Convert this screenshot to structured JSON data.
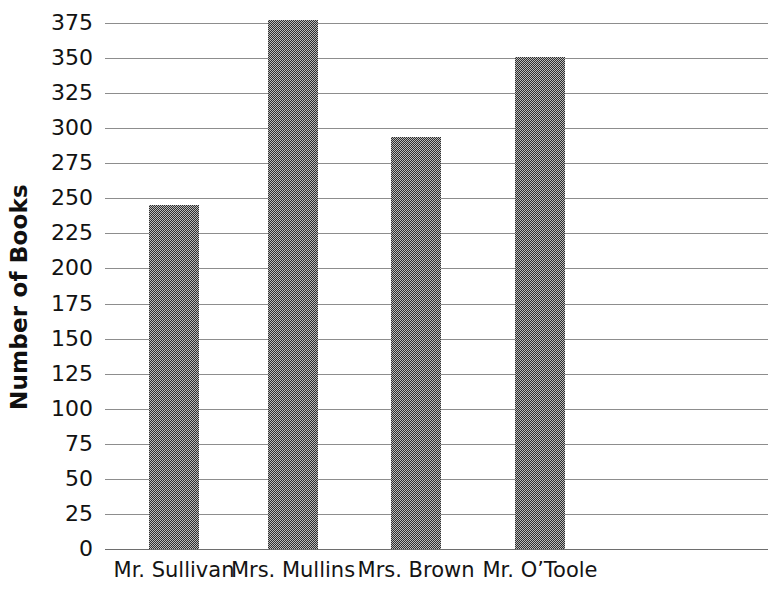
{
  "chart_data": {
    "type": "bar",
    "title": "",
    "xlabel": "",
    "ylabel": "Number of Books",
    "categories": [
      "Mr. Sullivan",
      "Mrs. Mullins",
      "Mrs. Brown",
      "Mr. O’Toole"
    ],
    "values": [
      245,
      377,
      294,
      351
    ],
    "ylim": [
      0,
      375
    ],
    "ytick_step": 25,
    "ytick_labels": [
      "375",
      "350",
      "325",
      "300",
      "275",
      "250",
      "225",
      "200",
      "175",
      "150",
      "125",
      "100",
      "75",
      "50",
      "25",
      "0"
    ],
    "ytick_values": [
      375,
      350,
      325,
      300,
      275,
      250,
      225,
      200,
      175,
      150,
      125,
      100,
      75,
      50,
      25,
      0
    ],
    "grid": true,
    "legend": false,
    "bar_color": "#646464",
    "gridline_color": "#8d8d8d",
    "text_color": "#121212",
    "background_color": "#ffffff"
  },
  "axis": {
    "y_title": "Number of Books"
  }
}
